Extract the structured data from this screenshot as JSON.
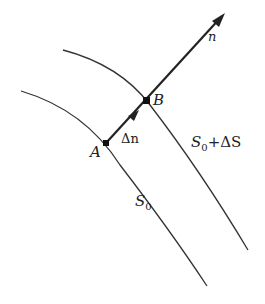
{
  "diagram": {
    "curves": [
      {
        "id": "S0",
        "label": "S",
        "label_sub": "0"
      },
      {
        "id": "S0_plus_dS",
        "label": "S",
        "label_sub": "0",
        "label_suffix": "+ΔS"
      }
    ],
    "points": [
      {
        "id": "A",
        "label": "A"
      },
      {
        "id": "B",
        "label": "B"
      }
    ],
    "vector": {
      "label": "n"
    },
    "segment": {
      "label": "Δn"
    },
    "colors": {
      "stroke": "#222222",
      "background": "#ffffff"
    }
  }
}
